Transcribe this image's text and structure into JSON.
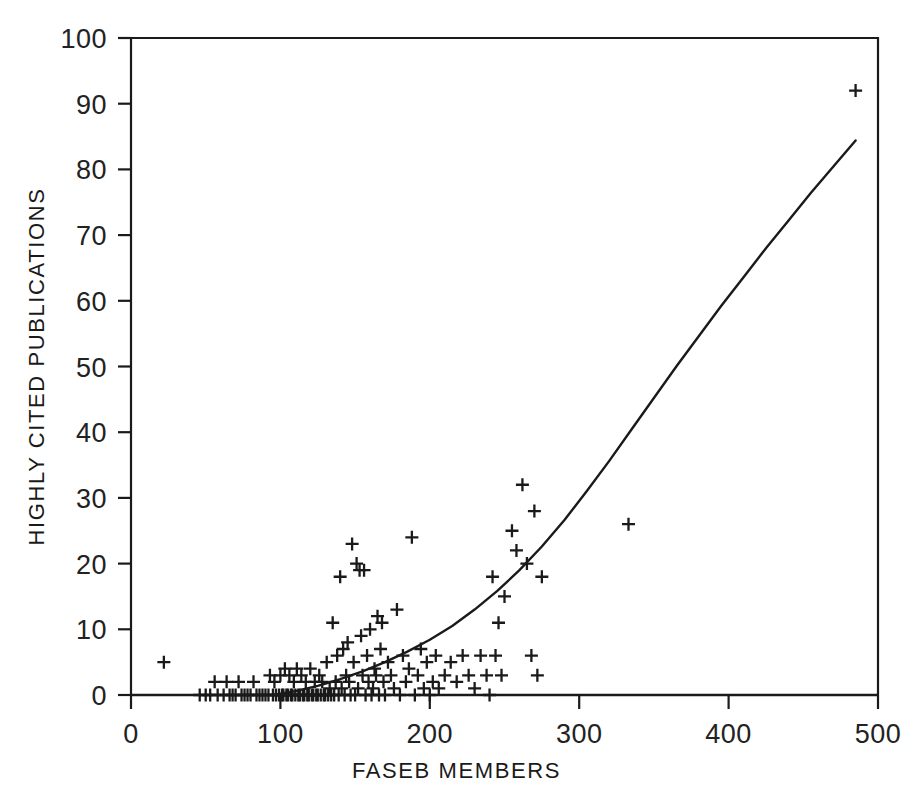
{
  "chart_data": {
    "type": "scatter",
    "title": "",
    "xlabel": "FASEB MEMBERS",
    "ylabel": "HIGHLY CITED PUBLICATIONS",
    "xlim": [
      0,
      500
    ],
    "ylim": [
      0,
      100
    ],
    "xticks": [
      0,
      100,
      200,
      300,
      400,
      500
    ],
    "yticks": [
      0,
      10,
      20,
      30,
      40,
      50,
      60,
      70,
      80,
      90,
      100
    ],
    "xtick_labels": [
      "0",
      "100",
      "200",
      "300",
      "400",
      "500"
    ],
    "ytick_labels": [
      "0",
      "10",
      "20",
      "30",
      "40",
      "50",
      "60",
      "70",
      "80",
      "90",
      "100"
    ],
    "grid": false,
    "legend": null,
    "marker": "plus",
    "marker_color": "#1a1a1a",
    "line_color": "#1a1a1a",
    "frame_color": "#1a1a1a",
    "background": "#ffffff",
    "series": [
      {
        "name": "Institutions",
        "type": "scatter",
        "points": [
          [
            22,
            5
          ],
          [
            46,
            0
          ],
          [
            50,
            0
          ],
          [
            53,
            0
          ],
          [
            56,
            2
          ],
          [
            58,
            0
          ],
          [
            62,
            0
          ],
          [
            64,
            2
          ],
          [
            66,
            0
          ],
          [
            68,
            0
          ],
          [
            70,
            0
          ],
          [
            72,
            2
          ],
          [
            74,
            0
          ],
          [
            76,
            0
          ],
          [
            78,
            0
          ],
          [
            80,
            0
          ],
          [
            82,
            2
          ],
          [
            84,
            0
          ],
          [
            86,
            0
          ],
          [
            88,
            0
          ],
          [
            90,
            0
          ],
          [
            92,
            0
          ],
          [
            93,
            3
          ],
          [
            95,
            0
          ],
          [
            96,
            2
          ],
          [
            97,
            0
          ],
          [
            99,
            0
          ],
          [
            100,
            3
          ],
          [
            101,
            0
          ],
          [
            102,
            0
          ],
          [
            103,
            4
          ],
          [
            104,
            0
          ],
          [
            105,
            0
          ],
          [
            106,
            3
          ],
          [
            107,
            0
          ],
          [
            108,
            0
          ],
          [
            109,
            2
          ],
          [
            110,
            0
          ],
          [
            111,
            4
          ],
          [
            112,
            0
          ],
          [
            113,
            0
          ],
          [
            114,
            3
          ],
          [
            115,
            0
          ],
          [
            116,
            0
          ],
          [
            117,
            2
          ],
          [
            118,
            0
          ],
          [
            119,
            0
          ],
          [
            120,
            4
          ],
          [
            121,
            0
          ],
          [
            122,
            0
          ],
          [
            123,
            2
          ],
          [
            124,
            0
          ],
          [
            125,
            0
          ],
          [
            126,
            3
          ],
          [
            127,
            0
          ],
          [
            128,
            2
          ],
          [
            129,
            0
          ],
          [
            130,
            0
          ],
          [
            131,
            5
          ],
          [
            132,
            0
          ],
          [
            133,
            1
          ],
          [
            134,
            0
          ],
          [
            135,
            11
          ],
          [
            136,
            0
          ],
          [
            137,
            2
          ],
          [
            138,
            6
          ],
          [
            139,
            0
          ],
          [
            140,
            18
          ],
          [
            141,
            1
          ],
          [
            142,
            7
          ],
          [
            143,
            0
          ],
          [
            144,
            3
          ],
          [
            145,
            8
          ],
          [
            146,
            2
          ],
          [
            147,
            0
          ],
          [
            148,
            23
          ],
          [
            149,
            5
          ],
          [
            150,
            0
          ],
          [
            151,
            20
          ],
          [
            152,
            1
          ],
          [
            153,
            19
          ],
          [
            154,
            9
          ],
          [
            155,
            3
          ],
          [
            156,
            19
          ],
          [
            157,
            0
          ],
          [
            158,
            6
          ],
          [
            159,
            2
          ],
          [
            160,
            10
          ],
          [
            161,
            0
          ],
          [
            162,
            1
          ],
          [
            163,
            4
          ],
          [
            164,
            3
          ],
          [
            165,
            12
          ],
          [
            166,
            0
          ],
          [
            167,
            7
          ],
          [
            168,
            11
          ],
          [
            169,
            2
          ],
          [
            170,
            0
          ],
          [
            172,
            5
          ],
          [
            174,
            3
          ],
          [
            176,
            1
          ],
          [
            178,
            13
          ],
          [
            180,
            0
          ],
          [
            182,
            6
          ],
          [
            184,
            2
          ],
          [
            186,
            4
          ],
          [
            188,
            24
          ],
          [
            190,
            0
          ],
          [
            192,
            3
          ],
          [
            194,
            7
          ],
          [
            196,
            1
          ],
          [
            198,
            5
          ],
          [
            200,
            0
          ],
          [
            202,
            2
          ],
          [
            204,
            6
          ],
          [
            206,
            1
          ],
          [
            210,
            3
          ],
          [
            214,
            5
          ],
          [
            218,
            2
          ],
          [
            222,
            6
          ],
          [
            226,
            3
          ],
          [
            230,
            1
          ],
          [
            234,
            6
          ],
          [
            238,
            3
          ],
          [
            240,
            0
          ],
          [
            242,
            18
          ],
          [
            244,
            6
          ],
          [
            246,
            11
          ],
          [
            248,
            3
          ],
          [
            250,
            15
          ],
          [
            255,
            25
          ],
          [
            258,
            22
          ],
          [
            262,
            32
          ],
          [
            265,
            20
          ],
          [
            268,
            6
          ],
          [
            270,
            28
          ],
          [
            272,
            3
          ],
          [
            275,
            18
          ],
          [
            333,
            26
          ],
          [
            485,
            92
          ]
        ]
      },
      {
        "name": "Fitted curve",
        "type": "line",
        "points": [
          [
            95,
            0.0
          ],
          [
            110,
            0.6
          ],
          [
            125,
            1.4
          ],
          [
            140,
            2.4
          ],
          [
            155,
            3.6
          ],
          [
            170,
            5.0
          ],
          [
            185,
            6.6
          ],
          [
            200,
            8.4
          ],
          [
            215,
            10.5
          ],
          [
            230,
            13.0
          ],
          [
            245,
            15.8
          ],
          [
            260,
            19.0
          ],
          [
            275,
            22.6
          ],
          [
            290,
            26.6
          ],
          [
            305,
            31.0
          ],
          [
            320,
            35.6
          ],
          [
            335,
            40.4
          ],
          [
            350,
            45.2
          ],
          [
            365,
            50.0
          ],
          [
            380,
            54.6
          ],
          [
            395,
            59.2
          ],
          [
            410,
            63.6
          ],
          [
            425,
            68.0
          ],
          [
            440,
            72.2
          ],
          [
            455,
            76.4
          ],
          [
            470,
            80.4
          ],
          [
            485,
            84.4
          ]
        ]
      }
    ]
  }
}
